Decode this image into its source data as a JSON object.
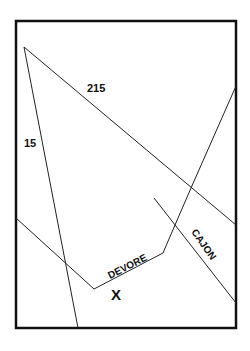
{
  "map": {
    "colors": {
      "background": "#ffffff",
      "ink": "#111111"
    },
    "frame": {
      "x": 16,
      "y": 21,
      "width": 220,
      "height": 307,
      "stroke_width": 2.5
    },
    "roads": [
      {
        "id": "i15",
        "label": "15",
        "points": [
          [
            24,
            47
          ],
          [
            78,
            328
          ]
        ],
        "label_pos": [
          24,
          147
        ],
        "label_rotate": 0
      },
      {
        "id": "i215",
        "label": "215",
        "points": [
          [
            24,
            47
          ],
          [
            236,
            225
          ]
        ],
        "label_pos": [
          88,
          92
        ],
        "label_rotate": 0
      },
      {
        "id": "devore-road",
        "label": "DEVORE",
        "points": [
          [
            16,
            218
          ],
          [
            94,
            289
          ],
          [
            163,
            253
          ],
          [
            175,
            225
          ],
          [
            191,
            188
          ],
          [
            236,
            86
          ]
        ],
        "label_pos": [
          109,
          275
        ],
        "label_rotate": -27
      },
      {
        "id": "cajon-road",
        "label": "CAJON",
        "points": [
          [
            154,
            198
          ],
          [
            236,
            303
          ]
        ],
        "label_pos": [
          191,
          232
        ],
        "label_rotate": 52
      }
    ],
    "marker": {
      "label": "X",
      "pos": [
        117,
        300
      ]
    }
  }
}
